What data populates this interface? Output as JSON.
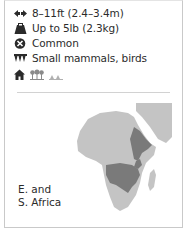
{
  "facts": {
    "length": {
      "icon": "arrows-horizontal-icon",
      "text": "8–11ft (2.4–3.4m)"
    },
    "weight": {
      "icon": "weight-icon",
      "text": "Up to 5lb (2.3kg)"
    },
    "status": {
      "icon": "status-circle-x-icon",
      "text": "Common"
    },
    "diet": {
      "icon": "teeth-icon",
      "text": "Small mammals, birds"
    }
  },
  "habitat_icons": [
    "house-icon",
    "woodland-icon",
    "grassland-icon"
  ],
  "map": {
    "region_label_line1": "E. and",
    "region_label_line2": "S. Africa",
    "colors": {
      "land": "#c4c4c4",
      "range": "#7a7a7a"
    }
  }
}
